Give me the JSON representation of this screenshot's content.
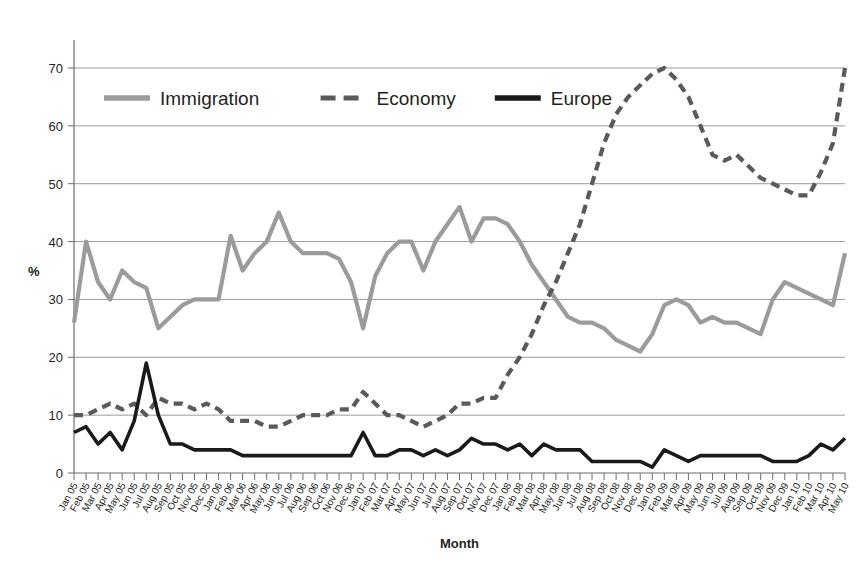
{
  "chart_data": {
    "type": "line",
    "title": "",
    "xlabel": "Month",
    "ylabel": "%",
    "ylim": [
      0,
      70
    ],
    "ytick_step": 10,
    "yticks": [
      0,
      10,
      20,
      30,
      40,
      50,
      60,
      70
    ],
    "grid": true,
    "legend_position": "top-left-inside",
    "categories": [
      "Jan 05",
      "Feb 05",
      "Mar 05",
      "Apr 05",
      "May 05",
      "Jun 05",
      "Jul 05",
      "Aug 05",
      "Sep 05",
      "Oct 05",
      "Nov 05",
      "Dec 05",
      "Jan 06",
      "Feb 06",
      "Mar 06",
      "Apr 06",
      "May 06",
      "Jun 06",
      "Jul 06",
      "Aug 06",
      "Sep 06",
      "Oct 06",
      "Nov 06",
      "Dec 06",
      "Jan 07",
      "Feb 07",
      "Mar 07",
      "Apr 07",
      "May 07",
      "Jun 07",
      "Jul 07",
      "Aug 07",
      "Sep 07",
      "Oct 07",
      "Nov 07",
      "Dec 07",
      "Jan 08",
      "Feb 08",
      "Mar 08",
      "Apr 08",
      "May 08",
      "Jun 08",
      "Jul 08",
      "Aug 08",
      "Sep 08",
      "Oct 08",
      "Nov 08",
      "Dec 08",
      "Jan 09",
      "Feb 09",
      "Mar 09",
      "Apr 09",
      "May 09",
      "Jun 09",
      "Jul 09",
      "Aug 09",
      "Sep 09",
      "Oct 09",
      "Nov 09",
      "Dec 09",
      "Jan 10",
      "Feb 10",
      "Mar 10",
      "Apr 10",
      "May 10"
    ],
    "series": [
      {
        "name": "Immigration",
        "style": "solid",
        "color": "#9b9b9b",
        "values": [
          26,
          40,
          33,
          30,
          35,
          33,
          32,
          25,
          27,
          29,
          30,
          30,
          30,
          41,
          35,
          38,
          40,
          45,
          40,
          38,
          38,
          38,
          37,
          33,
          25,
          34,
          38,
          40,
          40,
          35,
          40,
          43,
          46,
          40,
          44,
          44,
          43,
          40,
          36,
          33,
          30,
          27,
          26,
          26,
          25,
          23,
          22,
          21,
          24,
          29,
          30,
          29,
          26,
          27,
          26,
          26,
          25,
          24,
          30,
          33,
          32,
          31,
          30,
          29,
          38
        ]
      },
      {
        "name": "Economy",
        "style": "dashed",
        "color": "#5a5a5a",
        "values": [
          10,
          10,
          11,
          12,
          11,
          12,
          10,
          13,
          12,
          12,
          11,
          12,
          11,
          9,
          9,
          9,
          8,
          8,
          9,
          10,
          10,
          10,
          11,
          11,
          14,
          12,
          10,
          10,
          9,
          8,
          9,
          10,
          12,
          12,
          13,
          13,
          17,
          20,
          24,
          29,
          33,
          38,
          43,
          50,
          57,
          62,
          65,
          67,
          69,
          70,
          68,
          65,
          60,
          55,
          54,
          55,
          53,
          51,
          50,
          49,
          48,
          48,
          52,
          57,
          70
        ]
      },
      {
        "name": "Europe",
        "style": "solid",
        "color": "#1a1a1a",
        "values": [
          7,
          8,
          5,
          7,
          4,
          9,
          19,
          10,
          5,
          5,
          4,
          4,
          4,
          4,
          3,
          3,
          3,
          3,
          3,
          3,
          3,
          3,
          3,
          3,
          7,
          3,
          3,
          4,
          4,
          3,
          4,
          3,
          4,
          6,
          5,
          5,
          4,
          5,
          3,
          5,
          4,
          4,
          4,
          2,
          2,
          2,
          2,
          2,
          1,
          4,
          3,
          2,
          3,
          3,
          3,
          3,
          3,
          3,
          2,
          2,
          2,
          3,
          5,
          4,
          6
        ]
      }
    ],
    "legend": [
      {
        "label": "Immigration",
        "style": "solid",
        "color": "#9b9b9b"
      },
      {
        "label": "Economy",
        "style": "dashed",
        "color": "#5a5a5a"
      },
      {
        "label": "Europe",
        "style": "solid",
        "color": "#1a1a1a"
      }
    ]
  }
}
